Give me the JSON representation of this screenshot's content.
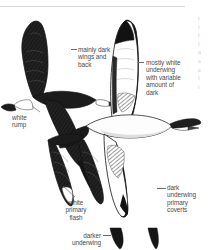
{
  "plate": {
    "kind": "field-guide-illustration",
    "subject": "albatross in flight",
    "background_color": "#ffffff",
    "label_color": "#4a4a4a",
    "leader_color": "#6f6f6f"
  },
  "labels": {
    "mainly_dark": "mainly dark\nwings and\nback",
    "mostly_white": "mostly white\nunderwing\nwith variable\namount of\ndark",
    "white_rump": "white\nrump",
    "white_primary_flash": "white\nprimary\nflash",
    "dark_underwing_coverts": "dark\nunderwing\nprimary\ncoverts",
    "darker_underwing": "darker\nunderwing"
  },
  "edge_text": {
    "lines": [
      "t",
      "i",
      "t",
      "l",
      "u",
      "a",
      "a",
      "l",
      "t"
    ]
  }
}
